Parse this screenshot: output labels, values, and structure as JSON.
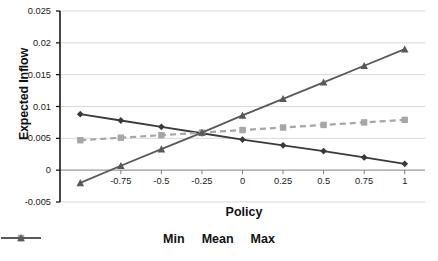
{
  "chart_data": {
    "type": "line",
    "title": "",
    "xlabel": "Policy",
    "ylabel": "Expected Inflow",
    "x": [
      -1,
      -0.75,
      -0.5,
      -0.25,
      0,
      0.25,
      0.5,
      0.75,
      1
    ],
    "xlim": [
      -1.125,
      1.125
    ],
    "ylim": [
      -0.005,
      0.025
    ],
    "xticks": [
      -0.75,
      -0.5,
      -0.25,
      0,
      0.25,
      0.5,
      0.75,
      1
    ],
    "xtick_labels": [
      "-0.75",
      "-0.5",
      "-0.25",
      "0",
      "0.25",
      "0.5",
      "0.75",
      "1"
    ],
    "yticks": [
      -0.005,
      0,
      0.005,
      0.01,
      0.015,
      0.02,
      0.025
    ],
    "ytick_labels": [
      "-0.005",
      "0",
      "0.005",
      "0.01",
      "0.015",
      "0.02",
      "0.025"
    ],
    "grid": "horizontal",
    "legend_position": "bottom",
    "series": [
      {
        "name": "Min",
        "marker": "diamond",
        "linestyle": "solid",
        "color": "#3a3a3a",
        "values": [
          0.0088,
          0.0078,
          0.0068,
          0.0058,
          0.0048,
          0.0039,
          0.003,
          0.002,
          0.001
        ]
      },
      {
        "name": "Mean",
        "marker": "square",
        "linestyle": "dashed",
        "color": "#a6a6a6",
        "values": [
          0.0047,
          0.0051,
          0.0055,
          0.0059,
          0.0063,
          0.0067,
          0.0071,
          0.0075,
          0.0079
        ]
      },
      {
        "name": "Max",
        "marker": "triangle",
        "linestyle": "solid",
        "color": "#595959",
        "values": [
          -0.002,
          0.0007,
          0.0033,
          0.0059,
          0.0086,
          0.0112,
          0.0138,
          0.0164,
          0.019
        ]
      }
    ]
  },
  "legend": {
    "items": [
      {
        "label": "Min"
      },
      {
        "label": "Mean"
      },
      {
        "label": "Max"
      }
    ]
  },
  "colors": {
    "axis": "#1a1a1a",
    "grid": "#d9d9d9",
    "min_series": "#3a3a3a",
    "mean_series": "#a6a6a6",
    "max_series": "#595959",
    "background": "#ffffff"
  }
}
